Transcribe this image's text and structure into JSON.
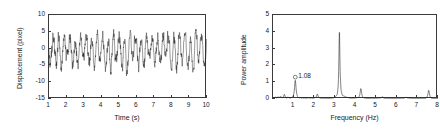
{
  "figure": {
    "panels": [
      "time-series",
      "power-spectrum"
    ]
  },
  "chart_data": [
    {
      "type": "line",
      "id": "time-series",
      "title": "",
      "xlabel": "Time (s)",
      "ylabel": "Displacement (pixel)",
      "xlim": [
        1,
        10
      ],
      "ylim": [
        -15,
        10
      ],
      "xticks": [
        1,
        2,
        3,
        4,
        5,
        6,
        7,
        8,
        9,
        10
      ],
      "xticklabels": [
        "1",
        "2",
        "3",
        "4",
        "5",
        "6",
        "7",
        "8",
        "9",
        "10"
      ],
      "yticks": [
        10,
        5,
        0,
        -5,
        -10,
        -15
      ],
      "yticklabels": [
        "10",
        "5",
        "0",
        "-5",
        "-10",
        "-15"
      ],
      "grid": false,
      "line_color": "#1a1a1a",
      "series": [
        {
          "name": "displacement",
          "description": "Broadband oscillatory displacement signal, dominant period approx 0.31 s (3.2 Hz) modulated by a slower 1.08 Hz component; amplitude envelope mostly between -10 and +10 pixels, mean near -0.5 pixel."
        }
      ],
      "signal_components": [
        {
          "frequency_hz": 1.08,
          "amplitude_pixel": 1.1
        },
        {
          "frequency_hz": 3.2,
          "amplitude_pixel": 4.1
        },
        {
          "frequency_hz": 4.25,
          "amplitude_pixel": 0.55
        },
        {
          "frequency_hz": 7.55,
          "amplitude_pixel": 0.45
        }
      ],
      "noise_level_pixel": 2.6,
      "n_samples": 900
    },
    {
      "type": "line",
      "id": "power-spectrum",
      "title": "",
      "xlabel": "Frequency (Hz)",
      "ylabel": "Power amplitude",
      "xlim": [
        0,
        8
      ],
      "ylim": [
        0,
        5
      ],
      "xticks": [
        1,
        2,
        3,
        4,
        5,
        6,
        7,
        8
      ],
      "xticklabels": [
        "1",
        "2",
        "3",
        "4",
        "5",
        "6",
        "7",
        "8"
      ],
      "yticks": [
        0,
        1,
        2,
        3,
        4,
        5
      ],
      "yticklabels": [
        "0",
        "1",
        "2",
        "3",
        "4",
        "5"
      ],
      "grid": false,
      "line_color": "#1a1a1a",
      "annotations": [
        {
          "label": "1.08",
          "marker": "circle-open",
          "x": 1.08,
          "y": 1.12,
          "label_offset_x": 0.14,
          "label_offset_y": 0.18
        }
      ],
      "peaks": [
        {
          "frequency_hz": 1.08,
          "power_amplitude": 1.12
        },
        {
          "frequency_hz": 3.22,
          "power_amplitude": 4.08
        },
        {
          "frequency_hz": 4.26,
          "power_amplitude": 0.62
        },
        {
          "frequency_hz": 7.55,
          "power_amplitude": 0.52
        },
        {
          "frequency_hz": 2.15,
          "power_amplitude": 0.3
        },
        {
          "frequency_hz": 0.55,
          "power_amplitude": 0.28
        },
        {
          "frequency_hz": 5.3,
          "power_amplitude": 0.14
        },
        {
          "frequency_hz": 6.45,
          "power_amplitude": 0.12
        }
      ],
      "baseline_power": 0.06,
      "x": [
        0.0,
        0.06,
        0.12,
        0.18,
        0.24,
        0.3,
        0.36,
        0.42,
        0.48,
        0.54,
        0.6,
        0.66,
        0.72,
        0.78,
        0.84,
        0.9,
        0.96,
        1.02,
        1.08,
        1.14,
        1.2,
        1.26,
        1.32,
        1.38,
        1.44,
        1.5,
        1.56,
        1.62,
        1.68,
        1.74,
        1.8,
        1.86,
        1.92,
        1.98,
        2.04,
        2.1,
        2.16,
        2.22,
        2.28,
        2.34,
        2.4,
        2.46,
        2.52,
        2.58,
        2.64,
        2.7,
        2.76,
        2.82,
        2.88,
        2.94,
        3.0,
        3.06,
        3.12,
        3.16,
        3.2,
        3.22,
        3.26,
        3.3,
        3.36,
        3.42,
        3.48,
        3.54,
        3.6,
        3.66,
        3.72,
        3.78,
        3.84,
        3.9,
        3.96,
        4.02,
        4.08,
        4.14,
        4.2,
        4.26,
        4.32,
        4.38,
        4.44,
        4.5,
        4.56,
        4.62,
        4.68,
        4.74,
        4.8,
        4.86,
        4.92,
        4.98,
        5.04,
        5.1,
        5.16,
        5.22,
        5.28,
        5.34,
        5.4,
        5.46,
        5.52,
        5.58,
        5.64,
        5.7,
        5.76,
        5.82,
        5.88,
        5.94,
        6.0,
        6.06,
        6.12,
        6.18,
        6.24,
        6.3,
        6.36,
        6.42,
        6.48,
        6.54,
        6.6,
        6.66,
        6.72,
        6.78,
        6.84,
        6.9,
        6.96,
        7.02,
        7.08,
        7.14,
        7.2,
        7.26,
        7.32,
        7.38,
        7.44,
        7.5,
        7.55,
        7.6,
        7.66,
        7.72,
        7.78,
        7.84,
        7.9,
        7.96,
        8.0
      ],
      "y": [
        0.02,
        0.09,
        0.2,
        0.13,
        0.24,
        0.16,
        0.27,
        0.19,
        0.13,
        0.28,
        0.18,
        0.1,
        0.21,
        0.14,
        0.09,
        0.16,
        0.24,
        0.6,
        1.12,
        0.55,
        0.17,
        0.1,
        0.15,
        0.09,
        0.13,
        0.08,
        0.12,
        0.07,
        0.11,
        0.14,
        0.08,
        0.12,
        0.07,
        0.1,
        0.15,
        0.22,
        0.3,
        0.2,
        0.11,
        0.07,
        0.1,
        0.06,
        0.09,
        0.05,
        0.08,
        0.06,
        0.09,
        0.07,
        0.1,
        0.13,
        0.2,
        0.3,
        0.55,
        1.4,
        3.1,
        4.08,
        2.6,
        0.95,
        0.4,
        0.34,
        0.28,
        0.22,
        0.17,
        0.13,
        0.11,
        0.09,
        0.08,
        0.09,
        0.1,
        0.12,
        0.14,
        0.17,
        0.3,
        0.62,
        0.34,
        0.16,
        0.1,
        0.08,
        0.07,
        0.06,
        0.07,
        0.06,
        0.08,
        0.07,
        0.06,
        0.08,
        0.07,
        0.09,
        0.1,
        0.12,
        0.14,
        0.11,
        0.09,
        0.07,
        0.06,
        0.07,
        0.06,
        0.05,
        0.06,
        0.05,
        0.06,
        0.05,
        0.06,
        0.07,
        0.06,
        0.07,
        0.08,
        0.09,
        0.1,
        0.11,
        0.12,
        0.1,
        0.09,
        0.08,
        0.07,
        0.06,
        0.05,
        0.06,
        0.05,
        0.06,
        0.05,
        0.06,
        0.05,
        0.06,
        0.07,
        0.06,
        0.07,
        0.18,
        0.52,
        0.22,
        0.09,
        0.06,
        0.05,
        0.06,
        0.05,
        0.06,
        0.04
      ]
    }
  ]
}
